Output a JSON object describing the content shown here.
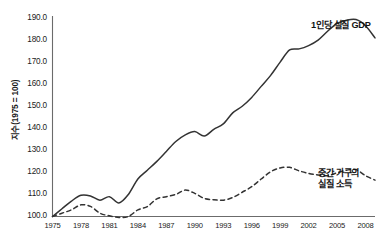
{
  "chart_data": {
    "type": "line",
    "title": "",
    "subtitle": "",
    "xlabel": "",
    "ylabel": "지수(1975 = 100)",
    "ylim": [
      100.0,
      190.0
    ],
    "xlim": [
      1975,
      2009
    ],
    "grid": false,
    "legend_position": "inline-annotation",
    "y_ticks": [
      "100.0",
      "110.0",
      "120.0",
      "130.0",
      "140.0",
      "150.0",
      "160.0",
      "170.0",
      "180.0",
      "190.0"
    ],
    "y_tick_values": [
      100.0,
      110.0,
      120.0,
      130.0,
      140.0,
      150.0,
      160.0,
      170.0,
      180.0,
      190.0
    ],
    "x_ticks": [
      "1975",
      "1978",
      "1981",
      "1984",
      "1987",
      "1990",
      "1993",
      "1996",
      "1999",
      "2002",
      "2005",
      "2008"
    ],
    "x_tick_values": [
      1975,
      1978,
      1981,
      1984,
      1987,
      1990,
      1993,
      1996,
      1999,
      2002,
      2005,
      2008
    ],
    "x": [
      1975,
      1976,
      1977,
      1978,
      1979,
      1980,
      1981,
      1982,
      1983,
      1984,
      1985,
      1986,
      1987,
      1988,
      1989,
      1990,
      1991,
      1992,
      1993,
      1994,
      1995,
      1996,
      1997,
      1998,
      1999,
      2000,
      2001,
      2002,
      2003,
      2004,
      2005,
      2006,
      2007,
      2008,
      2009
    ],
    "series": [
      {
        "name": "1인당 실질 GDP",
        "style": "solid",
        "color": "#333333",
        "annotation": "1인당 실질 GDP",
        "values": [
          100.0,
          103.5,
          107.0,
          109.6,
          109.3,
          107.4,
          109.0,
          106.1,
          110.0,
          117.0,
          121.0,
          125.0,
          129.5,
          134.0,
          137.0,
          138.5,
          136.5,
          139.5,
          142.0,
          147.0,
          150.0,
          154.0,
          159.0,
          164.0,
          170.0,
          175.5,
          176.0,
          177.5,
          180.0,
          184.0,
          187.5,
          189.0,
          189.3,
          186.5,
          181.0
        ]
      },
      {
        "name": "중간 가구의 실질 소득",
        "style": "dashed",
        "color": "#333333",
        "annotation": "중간 가구의\n실질 소득",
        "annotation_line1": "중간 가구의",
        "annotation_line2": "실질 소득",
        "values": [
          100.0,
          101.5,
          103.0,
          105.3,
          104.6,
          101.5,
          100.3,
          99.6,
          100.0,
          103.0,
          104.5,
          108.0,
          109.0,
          110.0,
          112.0,
          110.5,
          108.2,
          107.6,
          107.4,
          108.6,
          111.0,
          113.5,
          117.0,
          120.3,
          122.0,
          122.3,
          120.7,
          119.5,
          118.8,
          118.5,
          119.8,
          121.0,
          121.3,
          118.5,
          116.5
        ]
      }
    ]
  },
  "axes": {
    "y_axis_title": "지수(1975 = 100)"
  },
  "annotations": {
    "gdp_label": "1인당 실질 GDP",
    "income_label_line1": "중간 가구의",
    "income_label_line2": "실질 소득"
  }
}
